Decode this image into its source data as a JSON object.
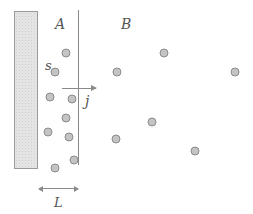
{
  "diagram": {
    "region_labels": {
      "left": "A",
      "right": "B"
    },
    "surface_label": "s",
    "flux_label": "j",
    "length_label": "L",
    "colors": {
      "particle_fill": "#c4c4c4",
      "particle_stroke": "#8c8c8c",
      "line": "#8a8a8a",
      "wall_fill": "#e4e4e4"
    },
    "particles_region_A": [
      {
        "x": 66,
        "y": 53
      },
      {
        "x": 55,
        "y": 72
      },
      {
        "x": 50,
        "y": 97
      },
      {
        "x": 72,
        "y": 99
      },
      {
        "x": 66,
        "y": 118
      },
      {
        "x": 48,
        "y": 132
      },
      {
        "x": 69,
        "y": 137
      },
      {
        "x": 74,
        "y": 160
      },
      {
        "x": 55,
        "y": 168
      }
    ],
    "particles_region_B": [
      {
        "x": 117,
        "y": 72
      },
      {
        "x": 164,
        "y": 53
      },
      {
        "x": 235,
        "y": 72
      },
      {
        "x": 116,
        "y": 139
      },
      {
        "x": 152,
        "y": 122
      },
      {
        "x": 195,
        "y": 151
      }
    ]
  }
}
